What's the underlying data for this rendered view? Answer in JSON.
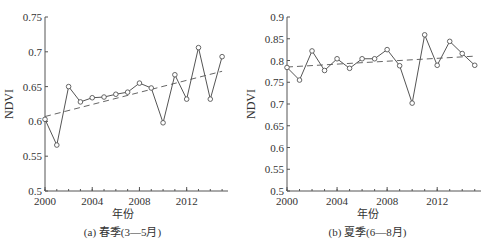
{
  "chart_data": [
    {
      "type": "line",
      "title": "(a) 春季(3—5月)",
      "xlabel": "年份",
      "ylabel": "NDVI",
      "x": [
        2000,
        2001,
        2002,
        2003,
        2004,
        2005,
        2006,
        2007,
        2008,
        2009,
        2010,
        2011,
        2012,
        2013,
        2014,
        2015
      ],
      "xticks": [
        "2000",
        "2004",
        "2008",
        "2012"
      ],
      "xlim": [
        2000,
        2015.5
      ],
      "ylim": [
        0.5,
        0.75
      ],
      "yticks": [
        "0.5",
        "0.55",
        "0.6",
        "0.65",
        "0.7",
        "0.75"
      ],
      "grid": false,
      "series": [
        {
          "name": "NDVI",
          "style": "solid line with circle markers",
          "values": [
            0.603,
            0.566,
            0.65,
            0.628,
            0.634,
            0.635,
            0.639,
            0.642,
            0.655,
            0.648,
            0.598,
            0.667,
            0.632,
            0.706,
            0.632,
            0.693
          ]
        },
        {
          "name": "trend",
          "style": "dashed",
          "values": [
            0.607,
            0.672
          ],
          "x": [
            2000,
            2015
          ]
        }
      ]
    },
    {
      "type": "line",
      "title": "(b) 夏季(6—8月)",
      "xlabel": "年份",
      "ylabel": "NDVI",
      "x": [
        2000,
        2001,
        2002,
        2003,
        2004,
        2005,
        2006,
        2007,
        2008,
        2009,
        2010,
        2011,
        2012,
        2013,
        2014,
        2015
      ],
      "xticks": [
        "2000",
        "2004",
        "2008",
        "2012"
      ],
      "xlim": [
        2000,
        2015.5
      ],
      "ylim": [
        0.5,
        0.9
      ],
      "yticks": [
        "0.5",
        "0.55",
        "0.6",
        "0.65",
        "0.7",
        "0.75",
        "0.8",
        "0.85",
        "0.9"
      ],
      "grid": false,
      "series": [
        {
          "name": "NDVI",
          "style": "solid line with circle markers",
          "values": [
            0.784,
            0.755,
            0.822,
            0.777,
            0.804,
            0.782,
            0.804,
            0.804,
            0.825,
            0.788,
            0.702,
            0.859,
            0.789,
            0.844,
            0.816,
            0.789
          ]
        },
        {
          "name": "trend",
          "style": "dashed",
          "values": [
            0.785,
            0.81
          ],
          "x": [
            2000,
            2015
          ]
        }
      ]
    }
  ],
  "panels": {
    "a": {
      "caption": "(a) 春季(3—5月)",
      "xlabel": "年份",
      "ylabel": "NDVI"
    },
    "b": {
      "caption": "(b) 夏季(6—8月)",
      "xlabel": "年份",
      "ylabel": "NDVI"
    }
  }
}
